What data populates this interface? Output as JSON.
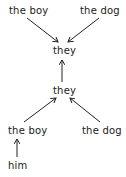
{
  "diagram": {
    "type": "coreference-graph",
    "nodes": [
      {
        "id": "n1",
        "label": "the boy",
        "x": 9,
        "y": 5
      },
      {
        "id": "n2",
        "label": "the dog",
        "x": 80,
        "y": 5
      },
      {
        "id": "n3",
        "label": "they",
        "x": 53,
        "y": 45
      },
      {
        "id": "n4",
        "label": "they",
        "x": 53,
        "y": 85
      },
      {
        "id": "n5",
        "label": "the boy",
        "x": 8,
        "y": 125
      },
      {
        "id": "n6",
        "label": "the dog",
        "x": 82,
        "y": 125
      },
      {
        "id": "n7",
        "label": "him",
        "x": 8,
        "y": 160
      }
    ],
    "edges": [
      {
        "from": "n1",
        "to": "n3"
      },
      {
        "from": "n2",
        "to": "n3"
      },
      {
        "from": "n4",
        "to": "n3"
      },
      {
        "from": "n5",
        "to": "n4"
      },
      {
        "from": "n6",
        "to": "n4"
      },
      {
        "from": "n7",
        "to": "n5"
      }
    ]
  }
}
